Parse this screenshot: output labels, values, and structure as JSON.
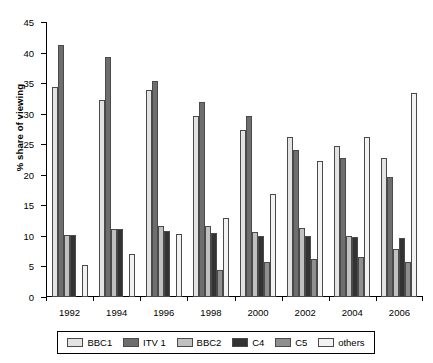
{
  "chart_data": {
    "type": "bar",
    "title": "",
    "xlabel": "",
    "ylabel": "% share of viewing",
    "ylim": [
      0,
      45
    ],
    "ytick_step": 5,
    "yticks": [
      0,
      5,
      10,
      15,
      20,
      25,
      30,
      35,
      40,
      45
    ],
    "grid": false,
    "legend_position": "bottom",
    "categories": [
      "1992",
      "1994",
      "1996",
      "1998",
      "2000",
      "2002",
      "2004",
      "2006"
    ],
    "series": [
      {
        "name": "BBC1",
        "color": "#e3e3e3",
        "values": [
          34.3,
          32.3,
          33.8,
          29.7,
          27.3,
          26.2,
          24.7,
          22.8
        ]
      },
      {
        "name": "ITV 1",
        "color": "#6e6e6e",
        "values": [
          41.2,
          39.3,
          35.3,
          31.9,
          29.6,
          24.1,
          22.8,
          19.6
        ]
      },
      {
        "name": "BBC2",
        "color": "#c0c0c0",
        "values": [
          10.2,
          11.2,
          11.7,
          11.6,
          10.7,
          11.3,
          10.0,
          7.8
        ]
      },
      {
        "name": "C4",
        "color": "#333333",
        "values": [
          10.2,
          11.2,
          10.8,
          10.5,
          10.0,
          10.0,
          9.8,
          9.7
        ]
      },
      {
        "name": "C5",
        "color": "#8f8f8f",
        "values": [
          0,
          0,
          0,
          4.5,
          5.7,
          6.3,
          6.6,
          5.7
        ]
      },
      {
        "name": "others",
        "color": "#f2f2f2",
        "values": [
          5.2,
          7.1,
          10.3,
          13.0,
          16.8,
          22.2,
          26.2,
          33.4
        ]
      }
    ]
  },
  "legend": {
    "items": [
      {
        "label": "BBC1"
      },
      {
        "label": "ITV 1"
      },
      {
        "label": "BBC2"
      },
      {
        "label": "C4"
      },
      {
        "label": "C5"
      },
      {
        "label": "others"
      }
    ]
  }
}
